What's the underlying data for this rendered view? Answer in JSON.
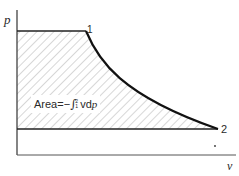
{
  "diagram": {
    "type": "p-v diagram",
    "axes": {
      "y_label": "p",
      "x_label": "v"
    },
    "points": [
      {
        "id": "1",
        "label": "1"
      },
      {
        "id": "2",
        "label": "2"
      }
    ],
    "area_label": {
      "prefix": "Area=−",
      "integral_sign": "∫",
      "upper_limit": "2",
      "lower_limit": "1",
      "integrand": "vd",
      "variable": "p"
    },
    "colors": {
      "line": "#1a1a1a",
      "axis": "#333333",
      "hatch": "#8a8a8a",
      "background": "#ffffff"
    }
  }
}
